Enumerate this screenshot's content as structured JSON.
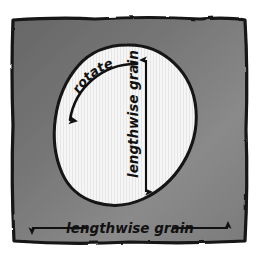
{
  "figure": {
    "kind": "hand-drawn-sewing-diagram",
    "background_color": "#ffffff",
    "fabric_color_dark": "#6d6d6d",
    "fabric_color_light": "#8f8f8f",
    "circle_fill": "#f4f4f4",
    "ink_color": "#111111"
  },
  "labels": {
    "vertical_grain": "lengthwise grain",
    "horizontal_grain": "lengthwise grain",
    "rotate": "rotate"
  },
  "arrows": {
    "vertical_arrow_name": "double-headed vertical arrow",
    "horizontal_arrow_name": "double-headed horizontal arrow",
    "rotate_arrow_name": "curved counterclockwise arrow"
  }
}
